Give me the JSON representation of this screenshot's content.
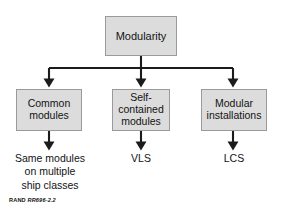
{
  "figure": {
    "type": "hierarchy-flowchart",
    "root": {
      "id": "modularity",
      "label": "Modularity"
    },
    "branches": [
      {
        "id": "common-modules",
        "label": "Common\nmodules",
        "leaf": "Same modules\non multiple\nship classes"
      },
      {
        "id": "self-contained-modules",
        "label": "Self-\ncontained\nmodules",
        "leaf": "VLS"
      },
      {
        "id": "modular-installations",
        "label": "Modular\ninstallations",
        "leaf": "LCS"
      }
    ],
    "caption": {
      "brand": "RAND",
      "id": "RR696-2.2"
    },
    "colors": {
      "box_fill": "#dcdcdc",
      "box_border": "#9a9a9a",
      "connector": "#1b1b1b",
      "text": "#131313",
      "background": "#ffffff"
    }
  }
}
